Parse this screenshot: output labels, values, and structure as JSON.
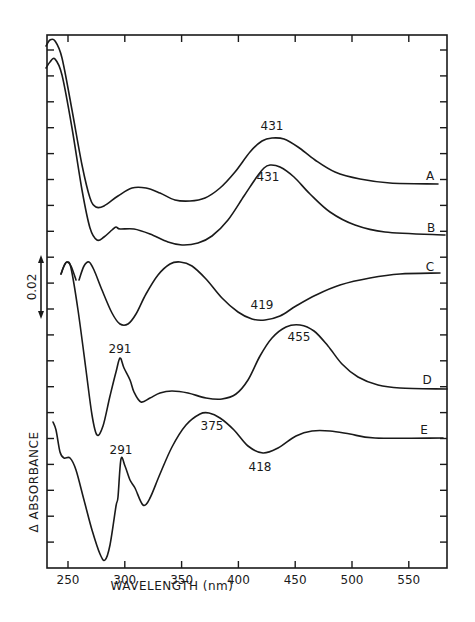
{
  "chart_data": {
    "type": "line",
    "title": "",
    "xlabel": "WAVELENGTH (nm)",
    "ylabel": "Δ ABSORBANCE",
    "xlim": [
      232,
      583
    ],
    "x_ticks": [
      250,
      300,
      350,
      400,
      450,
      500,
      550
    ],
    "x_tick_labels": [
      "250",
      "300",
      "350",
      "400",
      "450",
      "500",
      "550"
    ],
    "y_ticks_count": 20,
    "y_tick_labels": [],
    "grid": false,
    "legend": "curve labels at right end (A–E)",
    "scale_bar": {
      "label": "0.02",
      "units": "absorbance"
    },
    "series": [
      {
        "name": "A",
        "annotations": [
          {
            "x": 431,
            "text": "431",
            "kind": "peak"
          }
        ],
        "points_px": [
          [
            46,
            46
          ],
          [
            50,
            40
          ],
          [
            55,
            41
          ],
          [
            62,
            58
          ],
          [
            72,
            110
          ],
          [
            82,
            165
          ],
          [
            90,
            198
          ],
          [
            96,
            207
          ],
          [
            104,
            206
          ],
          [
            118,
            196
          ],
          [
            132,
            188
          ],
          [
            146,
            188
          ],
          [
            160,
            193
          ],
          [
            175,
            200
          ],
          [
            190,
            201
          ],
          [
            205,
            198
          ],
          [
            220,
            188
          ],
          [
            235,
            172
          ],
          [
            250,
            152
          ],
          [
            262,
            141
          ],
          [
            272,
            138
          ],
          [
            284,
            139
          ],
          [
            298,
            147
          ],
          [
            315,
            160
          ],
          [
            335,
            172
          ],
          [
            360,
            179
          ],
          [
            390,
            183
          ],
          [
            438,
            184
          ]
        ]
      },
      {
        "name": "B",
        "annotations": [
          {
            "x": 431,
            "text": "431",
            "kind": "peak"
          }
        ],
        "points_px": [
          [
            46,
            68
          ],
          [
            50,
            62
          ],
          [
            55,
            59
          ],
          [
            62,
            75
          ],
          [
            72,
            128
          ],
          [
            82,
            190
          ],
          [
            90,
            228
          ],
          [
            97,
            240
          ],
          [
            104,
            237
          ],
          [
            112,
            230
          ],
          [
            116,
            227
          ],
          [
            120,
            229
          ],
          [
            134,
            229
          ],
          [
            150,
            234
          ],
          [
            168,
            242
          ],
          [
            182,
            245
          ],
          [
            198,
            243
          ],
          [
            212,
            236
          ],
          [
            228,
            220
          ],
          [
            244,
            196
          ],
          [
            256,
            178
          ],
          [
            264,
            168
          ],
          [
            270,
            165
          ],
          [
            280,
            167
          ],
          [
            294,
            177
          ],
          [
            310,
            194
          ],
          [
            330,
            212
          ],
          [
            355,
            225
          ],
          [
            385,
            232
          ],
          [
            445,
            235
          ]
        ]
      },
      {
        "name": "C",
        "annotations": [
          {
            "x": 419,
            "text": "419",
            "kind": "trough"
          }
        ],
        "points_px": [
          [
            61,
            274
          ],
          [
            64,
            266
          ],
          [
            67,
            262
          ],
          [
            71,
            266
          ],
          [
            76,
            280
          ]
        ],
        "points_px_2": [
          [
            79,
            280
          ],
          [
            84,
            266
          ],
          [
            89,
            262
          ],
          [
            94,
            270
          ],
          [
            102,
            290
          ],
          [
            112,
            313
          ],
          [
            120,
            324
          ],
          [
            128,
            324
          ],
          [
            136,
            314
          ],
          [
            146,
            294
          ],
          [
            158,
            275
          ],
          [
            170,
            264
          ],
          [
            180,
            262
          ],
          [
            192,
            266
          ],
          [
            206,
            279
          ],
          [
            222,
            298
          ],
          [
            238,
            312
          ],
          [
            252,
            319
          ],
          [
            265,
            320
          ],
          [
            280,
            316
          ],
          [
            296,
            306
          ],
          [
            316,
            295
          ],
          [
            340,
            285
          ],
          [
            370,
            278
          ],
          [
            400,
            274
          ],
          [
            440,
            273
          ]
        ]
      },
      {
        "name": "D",
        "annotations": [
          {
            "x": 291,
            "text": "291",
            "kind": "peak"
          },
          {
            "x": 455,
            "text": "455",
            "kind": "peak"
          }
        ],
        "points_px": [
          [
            61,
            274
          ],
          [
            64,
            266
          ],
          [
            67,
            262
          ],
          [
            71,
            268
          ],
          [
            78,
            310
          ],
          [
            86,
            370
          ],
          [
            92,
            415
          ],
          [
            97,
            435
          ],
          [
            103,
            426
          ],
          [
            110,
            396
          ],
          [
            116,
            372
          ],
          [
            120,
            358
          ],
          [
            124,
            368
          ],
          [
            130,
            380
          ],
          [
            134,
            392
          ],
          [
            141,
            402
          ],
          [
            150,
            398
          ],
          [
            160,
            393
          ],
          [
            172,
            391
          ],
          [
            188,
            393
          ],
          [
            206,
            398
          ],
          [
            222,
            399
          ],
          [
            236,
            394
          ],
          [
            248,
            380
          ],
          [
            260,
            356
          ],
          [
            272,
            338
          ],
          [
            286,
            327
          ],
          [
            300,
            325
          ],
          [
            314,
            331
          ],
          [
            328,
            346
          ],
          [
            342,
            364
          ],
          [
            358,
            377
          ],
          [
            378,
            385
          ],
          [
            400,
            388
          ],
          [
            447,
            389
          ]
        ]
      },
      {
        "name": "E",
        "annotations": [
          {
            "x": 291,
            "text": "291",
            "kind": "peak"
          },
          {
            "x": 375,
            "text": "375",
            "kind": "peak"
          },
          {
            "x": 418,
            "text": "418",
            "kind": "trough"
          }
        ],
        "points_px": [
          [
            53,
            422
          ],
          [
            56,
            430
          ],
          [
            60,
            452
          ],
          [
            64,
            458
          ],
          [
            70,
            458
          ],
          [
            76,
            470
          ],
          [
            84,
            500
          ],
          [
            92,
            530
          ],
          [
            100,
            554
          ],
          [
            105,
            560
          ],
          [
            110,
            545
          ],
          [
            116,
            506
          ],
          [
            118,
            497
          ],
          [
            121,
            459
          ],
          [
            125,
            466
          ],
          [
            130,
            480
          ],
          [
            135,
            488
          ],
          [
            143,
            505
          ],
          [
            150,
            498
          ],
          [
            160,
            474
          ],
          [
            172,
            447
          ],
          [
            186,
            425
          ],
          [
            200,
            414
          ],
          [
            209,
            413
          ],
          [
            220,
            418
          ],
          [
            234,
            430
          ],
          [
            248,
            446
          ],
          [
            263,
            453
          ],
          [
            278,
            448
          ],
          [
            296,
            436
          ],
          [
            312,
            431
          ],
          [
            330,
            431
          ],
          [
            350,
            434
          ],
          [
            375,
            438
          ],
          [
            443,
            438
          ]
        ]
      }
    ],
    "curve_labels": [
      {
        "text": "A",
        "x_px": 430,
        "y_px": 180
      },
      {
        "text": "B",
        "x_px": 431,
        "y_px": 232
      },
      {
        "text": "C",
        "x_px": 430,
        "y_px": 271
      },
      {
        "text": "D",
        "x_px": 427,
        "y_px": 384
      },
      {
        "text": "E",
        "x_px": 424,
        "y_px": 434
      }
    ],
    "peak_labels": [
      {
        "text": "431",
        "x_px": 272,
        "y_px": 130,
        "series": "A"
      },
      {
        "text": "431",
        "x_px": 268,
        "y_px": 181,
        "series": "B"
      },
      {
        "text": "419",
        "x_px": 262,
        "y_px": 309,
        "series": "C"
      },
      {
        "text": "291",
        "x_px": 120,
        "y_px": 353,
        "series": "D"
      },
      {
        "text": "455",
        "x_px": 299,
        "y_px": 341,
        "series": "D"
      },
      {
        "text": "291",
        "x_px": 121,
        "y_px": 454,
        "series": "E"
      },
      {
        "text": "375",
        "x_px": 212,
        "y_px": 430,
        "series": "E"
      },
      {
        "text": "418",
        "x_px": 260,
        "y_px": 471,
        "series": "E"
      }
    ]
  },
  "labels": {
    "xlabel": "WAVELENGTH (nm)",
    "ylabel": "Δ ABSORBANCE",
    "scale": "0.02"
  }
}
